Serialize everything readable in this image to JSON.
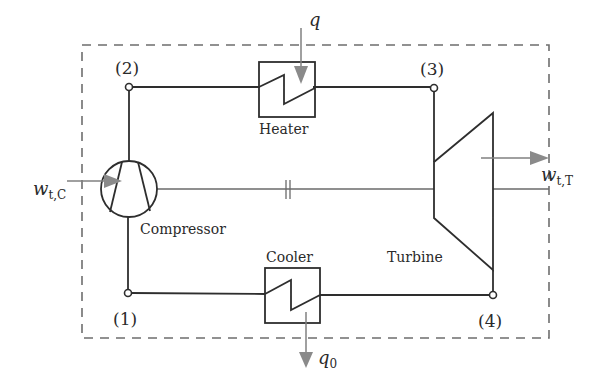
{
  "diagram": {
    "system_boundary": "dashed-control-volume",
    "nodes": [
      {
        "id": "1",
        "label": "(1)"
      },
      {
        "id": "2",
        "label": "(2)"
      },
      {
        "id": "3",
        "label": "(3)"
      },
      {
        "id": "4",
        "label": "(4)"
      }
    ],
    "components": {
      "compressor": {
        "label": "Compressor"
      },
      "heater": {
        "label": "Heater"
      },
      "cooler": {
        "label": "Cooler"
      },
      "turbine": {
        "label": "Turbine"
      }
    },
    "flows": {
      "heat_in": {
        "symbol": "q",
        "subscript": ""
      },
      "heat_out": {
        "symbol": "q",
        "subscript": "0"
      },
      "work_compressor": {
        "symbol": "w",
        "subscript": "t,C"
      },
      "work_turbine": {
        "symbol": "w",
        "subscript": "t,T"
      }
    },
    "connections": [
      {
        "from": "1",
        "to": "2",
        "via": "Compressor"
      },
      {
        "from": "2",
        "to": "3",
        "via": "Heater"
      },
      {
        "from": "3",
        "to": "4",
        "via": "Turbine"
      },
      {
        "from": "4",
        "to": "1",
        "via": "Cooler"
      }
    ],
    "shaft_break_symbol": "||"
  },
  "colors": {
    "line": "#2e2e2e",
    "arrow": "#8a8a8a",
    "dashed_boundary": "#6e6e6e",
    "background": "#ffffff"
  }
}
